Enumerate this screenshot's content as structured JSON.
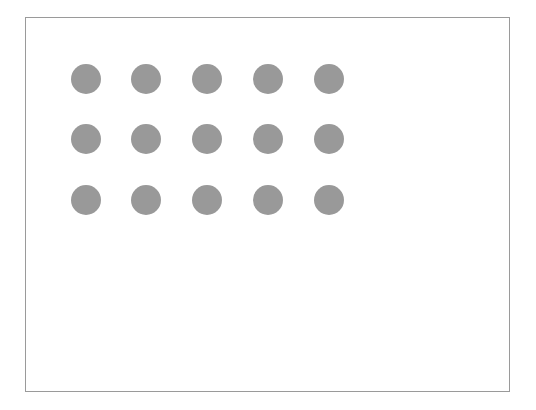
{
  "figure": {
    "title": "",
    "caption": "",
    "background_color": "#ffffff"
  },
  "panel": {
    "name": "bordered-panel",
    "border_color": "#9a9a9a",
    "border_width_px": 1,
    "fill_color": "#ffffff",
    "x": 25,
    "y": 17,
    "width": 485,
    "height": 375
  },
  "dot_grid": {
    "name": "circle-grid",
    "rows": 3,
    "columns": 5,
    "total_dots": 15,
    "dot_color": "#999999",
    "dot_diameter_px": 30,
    "column_centers_px": [
      60,
      120,
      181,
      242,
      303
    ],
    "row_centers_px": [
      61,
      121,
      182
    ],
    "column_spacing_px": 60,
    "row_spacing_px": 60,
    "dots": [
      {
        "id": "dot-r1-c1",
        "row": 1,
        "col": 1,
        "cx": 60,
        "cy": 61,
        "r": 15,
        "color": "#999999"
      },
      {
        "id": "dot-r1-c2",
        "row": 1,
        "col": 2,
        "cx": 120,
        "cy": 61,
        "r": 15,
        "color": "#999999"
      },
      {
        "id": "dot-r1-c3",
        "row": 1,
        "col": 3,
        "cx": 181,
        "cy": 61,
        "r": 15,
        "color": "#999999"
      },
      {
        "id": "dot-r1-c4",
        "row": 1,
        "col": 4,
        "cx": 242,
        "cy": 61,
        "r": 15,
        "color": "#999999"
      },
      {
        "id": "dot-r1-c5",
        "row": 1,
        "col": 5,
        "cx": 303,
        "cy": 61,
        "r": 15,
        "color": "#999999"
      },
      {
        "id": "dot-r2-c1",
        "row": 2,
        "col": 1,
        "cx": 60,
        "cy": 121,
        "r": 15,
        "color": "#999999"
      },
      {
        "id": "dot-r2-c2",
        "row": 2,
        "col": 2,
        "cx": 120,
        "cy": 121,
        "r": 15,
        "color": "#999999"
      },
      {
        "id": "dot-r2-c3",
        "row": 2,
        "col": 3,
        "cx": 181,
        "cy": 121,
        "r": 15,
        "color": "#999999"
      },
      {
        "id": "dot-r2-c4",
        "row": 2,
        "col": 4,
        "cx": 242,
        "cy": 121,
        "r": 15,
        "color": "#999999"
      },
      {
        "id": "dot-r2-c5",
        "row": 2,
        "col": 5,
        "cx": 303,
        "cy": 121,
        "r": 15,
        "color": "#999999"
      },
      {
        "id": "dot-r3-c1",
        "row": 3,
        "col": 1,
        "cx": 60,
        "cy": 182,
        "r": 15,
        "color": "#999999"
      },
      {
        "id": "dot-r3-c2",
        "row": 3,
        "col": 2,
        "cx": 120,
        "cy": 182,
        "r": 15,
        "color": "#999999"
      },
      {
        "id": "dot-r3-c3",
        "row": 3,
        "col": 3,
        "cx": 181,
        "cy": 182,
        "r": 15,
        "color": "#999999"
      },
      {
        "id": "dot-r3-c4",
        "row": 3,
        "col": 4,
        "cx": 242,
        "cy": 182,
        "r": 15,
        "color": "#999999"
      },
      {
        "id": "dot-r3-c5",
        "row": 3,
        "col": 5,
        "cx": 303,
        "cy": 182,
        "r": 15,
        "color": "#999999"
      }
    ]
  }
}
